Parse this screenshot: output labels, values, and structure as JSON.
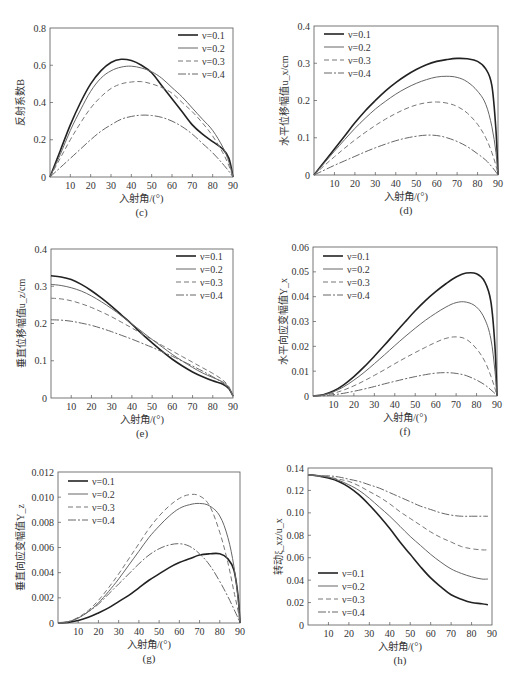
{
  "series_styles": [
    {
      "name": "ν=0.1",
      "stroke": "#222222",
      "width": 1.6,
      "dash": ""
    },
    {
      "name": "ν=0.2",
      "stroke": "#666666",
      "width": 1.0,
      "dash": ""
    },
    {
      "name": "ν=0.3",
      "stroke": "#777777",
      "width": 1.0,
      "dash": "5,3"
    },
    {
      "name": "ν=0.4",
      "stroke": "#666666",
      "width": 1.0,
      "dash": "8,2,2,2"
    }
  ],
  "chart_data": [
    {
      "id": "c",
      "type": "line",
      "caption": "(c)",
      "title": "",
      "xlabel": "入射角/(°)",
      "ylabel": "反射系数B",
      "xlim": [
        0,
        90
      ],
      "ylim": [
        0,
        0.8
      ],
      "xticks": [
        0,
        10,
        20,
        30,
        40,
        50,
        60,
        70,
        80,
        90
      ],
      "yticks": [
        0,
        0.2,
        0.4,
        0.6,
        0.8
      ],
      "ytick_labels": [
        "0",
        "0.2",
        "0.4",
        "0.6",
        "0.8"
      ],
      "legend_position": "upper-right",
      "box": {
        "left": 50,
        "top": 28,
        "right": 233,
        "bottom": 177
      },
      "legend_box": {
        "x": 178,
        "y": 35
      },
      "x": [
        0,
        5,
        10,
        15,
        20,
        25,
        30,
        35,
        40,
        45,
        50,
        55,
        60,
        65,
        70,
        75,
        80,
        85,
        88,
        90
      ],
      "series": [
        {
          "name": "ν=0.1",
          "values": [
            0,
            0.14,
            0.28,
            0.4,
            0.5,
            0.57,
            0.615,
            0.632,
            0.625,
            0.6,
            0.56,
            0.49,
            0.42,
            0.35,
            0.28,
            0.23,
            0.19,
            0.15,
            0.1,
            0
          ]
        },
        {
          "name": "ν=0.2",
          "values": [
            0,
            0.12,
            0.25,
            0.36,
            0.46,
            0.53,
            0.57,
            0.59,
            0.595,
            0.585,
            0.565,
            0.53,
            0.48,
            0.43,
            0.37,
            0.31,
            0.25,
            0.16,
            0.08,
            0
          ]
        },
        {
          "name": "ν=0.3",
          "values": [
            0,
            0.1,
            0.2,
            0.29,
            0.37,
            0.43,
            0.475,
            0.5,
            0.51,
            0.512,
            0.5,
            0.48,
            0.45,
            0.4,
            0.35,
            0.29,
            0.22,
            0.13,
            0.06,
            0
          ]
        },
        {
          "name": "ν=0.4",
          "values": [
            0,
            0.05,
            0.1,
            0.15,
            0.2,
            0.245,
            0.28,
            0.31,
            0.325,
            0.332,
            0.33,
            0.32,
            0.3,
            0.27,
            0.23,
            0.18,
            0.13,
            0.07,
            0.03,
            0
          ]
        }
      ]
    },
    {
      "id": "d",
      "type": "line",
      "caption": "(d)",
      "title": "",
      "xlabel": "入射角/(°)",
      "ylabel": "水平位移幅值u_x/cm",
      "xlim": [
        0,
        90
      ],
      "ylim": [
        0,
        0.4
      ],
      "xticks": [
        0,
        10,
        20,
        30,
        40,
        50,
        60,
        70,
        80,
        90
      ],
      "yticks": [
        0,
        0.1,
        0.2,
        0.3,
        0.4
      ],
      "ytick_labels": [
        "0",
        "0.1",
        "0.2",
        "0.3",
        "0.4"
      ],
      "legend_position": "upper-left",
      "box": {
        "left": 314,
        "top": 26,
        "right": 498,
        "bottom": 175
      },
      "legend_box": {
        "x": 324,
        "y": 34
      },
      "x": [
        0,
        5,
        10,
        15,
        20,
        25,
        30,
        35,
        40,
        45,
        50,
        55,
        60,
        65,
        70,
        75,
        80,
        84,
        87,
        89,
        90
      ],
      "series": [
        {
          "name": "ν=0.1",
          "values": [
            0,
            0.035,
            0.07,
            0.105,
            0.14,
            0.172,
            0.2,
            0.226,
            0.248,
            0.267,
            0.283,
            0.296,
            0.305,
            0.31,
            0.313,
            0.312,
            0.305,
            0.285,
            0.24,
            0.12,
            0
          ]
        },
        {
          "name": "ν=0.2",
          "values": [
            0,
            0.032,
            0.064,
            0.095,
            0.125,
            0.152,
            0.177,
            0.198,
            0.217,
            0.233,
            0.246,
            0.256,
            0.263,
            0.265,
            0.262,
            0.25,
            0.225,
            0.19,
            0.13,
            0.06,
            0
          ]
        },
        {
          "name": "ν=0.3",
          "values": [
            0,
            0.025,
            0.049,
            0.072,
            0.094,
            0.114,
            0.133,
            0.15,
            0.165,
            0.178,
            0.188,
            0.194,
            0.196,
            0.193,
            0.184,
            0.166,
            0.136,
            0.1,
            0.06,
            0.025,
            0
          ]
        },
        {
          "name": "ν=0.4",
          "values": [
            0,
            0.013,
            0.026,
            0.038,
            0.05,
            0.062,
            0.073,
            0.083,
            0.092,
            0.099,
            0.104,
            0.107,
            0.106,
            0.1,
            0.09,
            0.076,
            0.057,
            0.04,
            0.022,
            0.008,
            0
          ]
        }
      ]
    },
    {
      "id": "e",
      "type": "line",
      "caption": "(e)",
      "title": "",
      "xlabel": "入射角/(°)",
      "ylabel": "垂直位移幅值u_z/cm",
      "xlim": [
        0,
        90
      ],
      "ylim": [
        0,
        0.4
      ],
      "xticks": [
        0,
        10,
        20,
        30,
        40,
        50,
        60,
        70,
        80,
        90
      ],
      "yticks": [
        0,
        0.1,
        0.2,
        0.3,
        0.4
      ],
      "ytick_labels": [
        "0",
        "0.1",
        "0.2",
        "0.3",
        "0.4"
      ],
      "legend_position": "upper-right",
      "box": {
        "left": 51,
        "top": 249,
        "right": 233,
        "bottom": 398
      },
      "legend_box": {
        "x": 176,
        "y": 256
      },
      "x": [
        0,
        5,
        10,
        15,
        20,
        25,
        30,
        35,
        40,
        45,
        50,
        55,
        60,
        65,
        70,
        75,
        80,
        85,
        88,
        90
      ],
      "series": [
        {
          "name": "ν=0.1",
          "values": [
            0.328,
            0.325,
            0.318,
            0.305,
            0.288,
            0.268,
            0.246,
            0.222,
            0.198,
            0.172,
            0.148,
            0.125,
            0.104,
            0.086,
            0.07,
            0.057,
            0.046,
            0.037,
            0.025,
            0.005
          ]
        },
        {
          "name": "ν=0.2",
          "values": [
            0.305,
            0.302,
            0.296,
            0.287,
            0.274,
            0.258,
            0.24,
            0.22,
            0.199,
            0.178,
            0.157,
            0.137,
            0.117,
            0.099,
            0.082,
            0.067,
            0.055,
            0.043,
            0.028,
            0.005
          ]
        },
        {
          "name": "ν=0.3",
          "values": [
            0.268,
            0.266,
            0.261,
            0.253,
            0.243,
            0.231,
            0.218,
            0.203,
            0.188,
            0.172,
            0.157,
            0.141,
            0.126,
            0.111,
            0.096,
            0.081,
            0.066,
            0.048,
            0.03,
            0.005
          ]
        },
        {
          "name": "ν=0.4",
          "values": [
            0.21,
            0.209,
            0.206,
            0.201,
            0.195,
            0.187,
            0.178,
            0.168,
            0.158,
            0.147,
            0.136,
            0.124,
            0.112,
            0.099,
            0.086,
            0.072,
            0.057,
            0.04,
            0.025,
            0.005
          ]
        }
      ]
    },
    {
      "id": "f",
      "type": "line",
      "caption": "(f)",
      "title": "",
      "xlabel": "入射角/(°)",
      "ylabel": "水平向应变幅值Y_x",
      "xlim": [
        0,
        90
      ],
      "ylim": [
        0,
        0.06
      ],
      "xticks": [
        0,
        10,
        20,
        30,
        40,
        50,
        60,
        70,
        80,
        90
      ],
      "yticks": [
        0,
        0.01,
        0.02,
        0.03,
        0.04,
        0.05,
        0.06
      ],
      "ytick_labels": [
        "0",
        "0.01",
        "0.02",
        "0.03",
        "0.04",
        "0.05",
        "0.06"
      ],
      "legend_position": "upper-left",
      "box": {
        "left": 313,
        "top": 247,
        "right": 497,
        "bottom": 396
      },
      "legend_box": {
        "x": 323,
        "y": 256
      },
      "x": [
        0,
        5,
        10,
        15,
        20,
        25,
        30,
        35,
        40,
        45,
        50,
        55,
        60,
        65,
        70,
        75,
        80,
        84,
        87,
        89,
        90
      ],
      "series": [
        {
          "name": "ν=0.1",
          "values": [
            0,
            0.0005,
            0.002,
            0.0045,
            0.0078,
            0.0117,
            0.016,
            0.0205,
            0.0252,
            0.0298,
            0.0343,
            0.0384,
            0.042,
            0.0452,
            0.0479,
            0.0495,
            0.0492,
            0.046,
            0.038,
            0.02,
            0
          ]
        },
        {
          "name": "ν=0.2",
          "values": [
            0,
            0.0004,
            0.0017,
            0.0037,
            0.0064,
            0.0095,
            0.013,
            0.0166,
            0.0203,
            0.0239,
            0.0273,
            0.0305,
            0.0333,
            0.0358,
            0.0376,
            0.0378,
            0.0358,
            0.031,
            0.023,
            0.01,
            0
          ]
        },
        {
          "name": "ν=0.3",
          "values": [
            0,
            0.0003,
            0.0011,
            0.0024,
            0.0041,
            0.0061,
            0.0083,
            0.0106,
            0.013,
            0.0153,
            0.0175,
            0.0196,
            0.0216,
            0.0232,
            0.0238,
            0.0228,
            0.019,
            0.014,
            0.008,
            0.003,
            0
          ]
        },
        {
          "name": "ν=0.4",
          "values": [
            0,
            0.0001,
            0.0005,
            0.0011,
            0.0019,
            0.0028,
            0.0038,
            0.0049,
            0.0059,
            0.0069,
            0.0078,
            0.0086,
            0.0092,
            0.0094,
            0.0091,
            0.0082,
            0.0064,
            0.0045,
            0.0025,
            0.001,
            0
          ]
        }
      ]
    },
    {
      "id": "g",
      "type": "line",
      "caption": "(g)",
      "title": "",
      "xlabel": "入射角/(°)",
      "ylabel": "垂直向应变幅值Y_z",
      "xlim": [
        0,
        90
      ],
      "ylim": [
        0,
        0.012
      ],
      "xticks": [
        0,
        10,
        20,
        30,
        40,
        50,
        60,
        70,
        80,
        90
      ],
      "yticks": [
        0,
        0.002,
        0.004,
        0.006,
        0.008,
        0.01,
        0.012
      ],
      "ytick_labels": [
        "0",
        "0.002",
        "0.004",
        "0.006",
        "0.008",
        "0.010",
        "0.012"
      ],
      "legend_position": "upper-left",
      "box": {
        "left": 58,
        "top": 472,
        "right": 240,
        "bottom": 623
      },
      "legend_box": {
        "x": 68,
        "y": 481
      },
      "x": [
        0,
        5,
        10,
        15,
        20,
        25,
        30,
        35,
        40,
        45,
        50,
        55,
        60,
        65,
        70,
        75,
        80,
        84,
        87,
        89,
        90
      ],
      "series": [
        {
          "name": "ν=0.1",
          "values": [
            0,
            5e-05,
            0.0002,
            0.00045,
            0.0008,
            0.0012,
            0.0017,
            0.0022,
            0.0028,
            0.0034,
            0.0039,
            0.0044,
            0.0048,
            0.0051,
            0.0054,
            0.0055,
            0.0055,
            0.0051,
            0.0042,
            0.0022,
            0
          ]
        },
        {
          "name": "ν=0.2",
          "values": [
            0,
            0.0001,
            0.0004,
            0.0009,
            0.0016,
            0.0025,
            0.0035,
            0.0046,
            0.0057,
            0.0068,
            0.0077,
            0.0085,
            0.0091,
            0.0094,
            0.0095,
            0.0093,
            0.0085,
            0.0068,
            0.0045,
            0.002,
            0
          ]
        },
        {
          "name": "ν=0.3",
          "values": [
            0,
            0.0001,
            0.00045,
            0.001,
            0.0018,
            0.0028,
            0.0039,
            0.0051,
            0.0063,
            0.0075,
            0.0085,
            0.0093,
            0.0099,
            0.0102,
            0.0101,
            0.0093,
            0.0072,
            0.0048,
            0.0025,
            0.001,
            0
          ]
        },
        {
          "name": "ν=0.4",
          "values": [
            0,
            0.0001,
            0.0004,
            0.0009,
            0.0015,
            0.0023,
            0.0031,
            0.0039,
            0.0047,
            0.0054,
            0.0059,
            0.0062,
            0.0063,
            0.0061,
            0.0055,
            0.0046,
            0.0033,
            0.0021,
            0.0011,
            0.0004,
            0
          ]
        }
      ]
    },
    {
      "id": "h",
      "type": "line",
      "caption": "(h)",
      "title": "",
      "xlabel": "入射角/(°)",
      "ylabel": "转动ξ_xz/u_x",
      "xlim": [
        0,
        90
      ],
      "ylim": [
        0,
        0.14
      ],
      "xticks": [
        0,
        10,
        20,
        30,
        40,
        50,
        60,
        70,
        80,
        90
      ],
      "yticks": [
        0,
        0.02,
        0.04,
        0.06,
        0.08,
        0.1,
        0.12,
        0.14
      ],
      "ytick_labels": [
        "0",
        "0.02",
        "0.04",
        "0.06",
        "0.08",
        "0.10",
        "0.12",
        "0.14"
      ],
      "legend_position": "lower-left",
      "box": {
        "left": 308,
        "top": 468,
        "right": 492,
        "bottom": 625
      },
      "legend_box": {
        "x": 318,
        "y": 573
      },
      "x": [
        0,
        5,
        10,
        15,
        20,
        25,
        30,
        35,
        40,
        45,
        50,
        55,
        60,
        65,
        70,
        75,
        80,
        85,
        88
      ],
      "series": [
        {
          "name": "ν=0.1",
          "values": [
            0.134,
            0.133,
            0.131,
            0.128,
            0.123,
            0.116,
            0.107,
            0.097,
            0.086,
            0.074,
            0.063,
            0.052,
            0.042,
            0.034,
            0.027,
            0.023,
            0.02,
            0.019,
            0.018
          ]
        },
        {
          "name": "ν=0.2",
          "values": [
            0.134,
            0.133,
            0.132,
            0.129,
            0.125,
            0.12,
            0.113,
            0.105,
            0.097,
            0.088,
            0.079,
            0.071,
            0.063,
            0.056,
            0.05,
            0.046,
            0.043,
            0.041,
            0.041
          ]
        },
        {
          "name": "ν=0.3",
          "values": [
            0.134,
            0.133,
            0.132,
            0.13,
            0.128,
            0.124,
            0.119,
            0.114,
            0.108,
            0.101,
            0.095,
            0.089,
            0.083,
            0.078,
            0.074,
            0.07,
            0.068,
            0.067,
            0.067
          ]
        },
        {
          "name": "ν=0.4",
          "values": [
            0.134,
            0.133,
            0.133,
            0.132,
            0.13,
            0.128,
            0.125,
            0.122,
            0.118,
            0.114,
            0.11,
            0.106,
            0.103,
            0.1,
            0.098,
            0.097,
            0.097,
            0.097,
            0.097
          ]
        }
      ]
    }
  ]
}
